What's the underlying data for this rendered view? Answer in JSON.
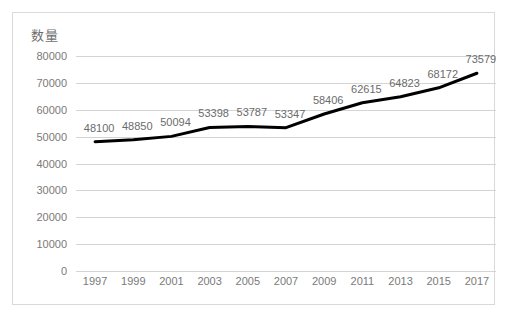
{
  "chart_data": {
    "type": "line",
    "title": "",
    "ylabel": "数量",
    "xlabel": "",
    "categories": [
      "1997",
      "1999",
      "2001",
      "2003",
      "2005",
      "2007",
      "2009",
      "2011",
      "2013",
      "2015",
      "2017"
    ],
    "values": [
      48100,
      48850,
      50094,
      53398,
      53787,
      53347,
      58406,
      62615,
      64823,
      68172,
      73579
    ],
    "data_labels": [
      "48100",
      "48850",
      "50094",
      "53398",
      "53787",
      "53347",
      "58406",
      "62615",
      "64823",
      "68172",
      "73579"
    ],
    "ylim": [
      0,
      80000
    ],
    "y_ticks": [
      0,
      10000,
      20000,
      30000,
      40000,
      50000,
      60000,
      70000,
      80000
    ],
    "y_tick_labels": [
      "0",
      "10000",
      "20000",
      "30000",
      "40000",
      "50000",
      "60000",
      "70000",
      "80000"
    ],
    "grid": true,
    "legend": "none",
    "series": [
      {
        "name": "数量",
        "values": [
          48100,
          48850,
          50094,
          53398,
          53787,
          53347,
          58406,
          62615,
          64823,
          68172,
          73579
        ]
      }
    ],
    "colors": {
      "line": "#000000",
      "gridline": "#d4d4d4",
      "tick_text": "#7a7a7a",
      "label_text": "#6b6b6b",
      "border": "#d9d9d9",
      "background": "#ffffff"
    },
    "line_width_px": 3
  }
}
